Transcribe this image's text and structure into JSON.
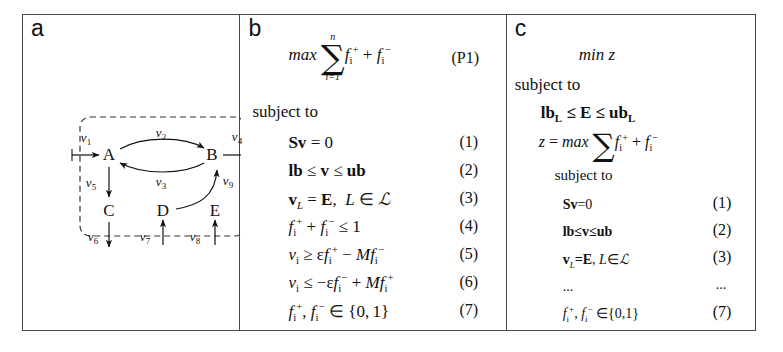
{
  "figure": {
    "panels": [
      {
        "id": "a",
        "letter": "a",
        "type": "network-diagram",
        "nodes": [
          {
            "id": "A",
            "label": "A",
            "x": 86,
            "y": 140
          },
          {
            "id": "B",
            "label": "B",
            "x": 189,
            "y": 140
          },
          {
            "id": "C",
            "label": "C",
            "x": 86,
            "y": 196
          },
          {
            "id": "D",
            "label": "D",
            "x": 140,
            "y": 196
          },
          {
            "id": "E",
            "label": "E",
            "x": 192,
            "y": 196
          }
        ],
        "flux_labels": [
          {
            "name": "v1",
            "base": "v",
            "sub": "1",
            "x": 63,
            "y": 123
          },
          {
            "name": "v2",
            "base": "v",
            "sub": "2",
            "x": 138,
            "y": 118
          },
          {
            "name": "v3",
            "base": "v",
            "sub": "3",
            "x": 138,
            "y": 167
          },
          {
            "name": "v4",
            "base": "v",
            "sub": "4",
            "x": 214,
            "y": 122
          },
          {
            "name": "v5",
            "base": "v",
            "sub": "5",
            "x": 68,
            "y": 168
          },
          {
            "name": "v6",
            "base": "v",
            "sub": "6",
            "x": 70,
            "y": 222
          },
          {
            "name": "v7",
            "base": "v",
            "sub": "7",
            "x": 122,
            "y": 222
          },
          {
            "name": "v8",
            "base": "v",
            "sub": "8",
            "x": 172,
            "y": 222
          },
          {
            "name": "v9",
            "base": "v",
            "sub": "9",
            "x": 205,
            "y": 166
          }
        ],
        "boundary": {
          "style": "dashed",
          "x": 57,
          "y": 102,
          "width": 165,
          "height": 119
        }
      },
      {
        "id": "b",
        "letter": "b",
        "type": "equations",
        "objective_tag": "(P1)",
        "subject_to": "subject to",
        "equation_tags": [
          "(1)",
          "(2)",
          "(3)",
          "(4)",
          "(5)",
          "(6)",
          "(7)"
        ],
        "equations_plain": [
          "max sum_{i=1}^{n} f_i^+ + f_i^-",
          "Sv = 0",
          "lb <= v <= ub",
          "v_L = E,  L in L-script",
          "f_i^+ + f_i^- <= 1",
          "v_i >= eps f_i^+ - M f_i^-",
          "v_i <= -eps f_i^- + M f_i^+",
          "f_i^+ , f_i^- in {0,1}"
        ],
        "sum_upper": "n",
        "sum_lower": "i=1",
        "max_label": "max"
      },
      {
        "id": "c",
        "letter": "c",
        "type": "equations",
        "objective": "min z",
        "subject_to": "subject to",
        "inner_subject_to": "subject to",
        "bounds_line": "lbL <= E <= ubL",
        "z_line": "z = max sum f_i^+ + f_i^-",
        "ellipsis": "...",
        "equation_tags": [
          "(1)",
          "(2)",
          "(3)",
          "...",
          "(7)"
        ],
        "equations_plain": [
          "Sv=0",
          "lb<=v<=ub",
          "v_L=E,  L in L-script",
          "...",
          "f_i^+ , f_i^- in {0,1}"
        ]
      }
    ]
  },
  "colors": {
    "ink": "#1a1a1a",
    "border": "#4a4a4a",
    "background": "#ffffff"
  }
}
